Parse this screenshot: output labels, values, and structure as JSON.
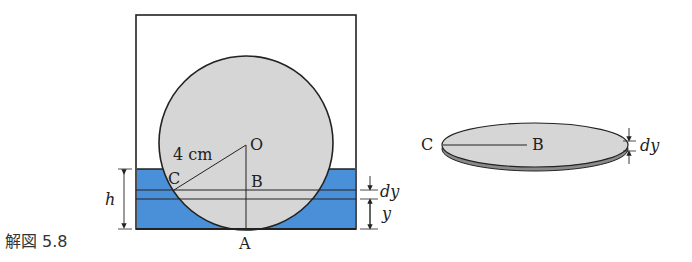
{
  "caption": "解図 5.8",
  "left_figure": {
    "labels": {
      "radius": "4 cm",
      "center": "O",
      "point_c": "C",
      "point_b": "B",
      "point_a": "A",
      "height": "h",
      "dy": "dy",
      "y": "y"
    },
    "colors": {
      "water": "#4a90d9",
      "sphere": "#d6d6d6",
      "outline": "#222222"
    }
  },
  "right_figure": {
    "labels": {
      "point_c": "C",
      "point_b": "B",
      "dy": "dy"
    },
    "colors": {
      "disk": "#d6d6d6",
      "disk_edge": "#8a8a8a"
    }
  }
}
